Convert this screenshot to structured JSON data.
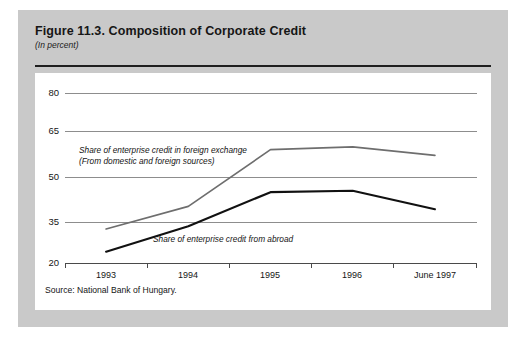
{
  "figure": {
    "title": "Figure 11.3.  Composition of Corporate Credit",
    "subtitle": "(In percent)",
    "source": "Source:  National Bank of Hungary."
  },
  "colors": {
    "panel_background": "#c9c9c9",
    "card_background": "#ffffff",
    "gridline": "#8d8d8d",
    "axis": "#4a4a4a",
    "series_foreign_exchange": "#6e6e6e",
    "series_from_abroad": "#111111",
    "text": "#161616"
  },
  "chart_data": {
    "type": "line",
    "title": "Figure 11.3.  Composition of Corporate Credit",
    "subtitle": "(In percent)",
    "xlabel": "",
    "ylabel": "",
    "x": [
      "1993",
      "1994",
      "1995",
      "1996",
      "June 1997"
    ],
    "tick_labels": [
      "1993",
      "1994",
      "1995",
      "1996",
      "June 1997"
    ],
    "yticks": [
      20,
      35,
      50,
      65,
      80
    ],
    "ylim": [
      20,
      80
    ],
    "grid": true,
    "legend": "annotations-inline",
    "series": [
      {
        "name": "Share of enterprise credit in foreign exchange (From domestic and foreign sources)",
        "color": "#6e6e6e",
        "values": [
          32,
          40,
          60,
          61,
          58
        ]
      },
      {
        "name": "Share of enterprise credit from abroad",
        "color": "#111111",
        "values": [
          24,
          33,
          45,
          45.5,
          39
        ]
      }
    ],
    "annotations": [
      {
        "id": "fx",
        "line1": "Share of enterprise credit in foreign exchange",
        "line2": "(From domestic and foreign sources)"
      },
      {
        "id": "abroad",
        "line1": "Share of enterprise credit from abroad"
      }
    ]
  }
}
